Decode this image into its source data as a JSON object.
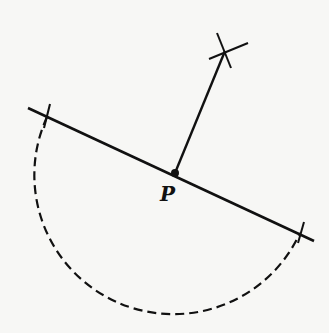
{
  "diagram": {
    "colors": {
      "background": "#f7f7f5",
      "ink": "#111111"
    },
    "line": {
      "start": [
        28,
        108
      ],
      "end": [
        314,
        241
      ]
    },
    "point": {
      "label": "P",
      "position": [
        175,
        173
      ],
      "label_position": [
        160,
        201
      ]
    },
    "semicircle": {
      "center": [
        175,
        173
      ],
      "radius": 139,
      "style": "dashed",
      "from": [
        47,
        117
      ],
      "to": [
        300,
        233
      ]
    },
    "ticks": [
      {
        "from": [
          50,
          104
        ],
        "to": [
          44,
          128
        ]
      },
      {
        "from": [
          304,
          222
        ],
        "to": [
          298,
          243
        ]
      }
    ],
    "perpendicular": {
      "from": [
        175,
        173
      ],
      "to": [
        225,
        51
      ]
    },
    "arc_marks": [
      {
        "from": [
          217,
          33
        ],
        "to": [
          231,
          68
        ]
      },
      {
        "from": [
          209,
          59
        ],
        "to": [
          248,
          43
        ]
      }
    ]
  }
}
